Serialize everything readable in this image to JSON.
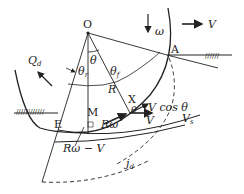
{
  "labels": {
    "O": "O",
    "A": "A",
    "E": "E",
    "M": "M",
    "X": "X",
    "R": "R",
    "omega": "ω",
    "V_top": "V",
    "Q_d": "Q",
    "Q_d_sub": "d",
    "theta": "θ",
    "theta_r": "θ",
    "theta_r_sub": "r",
    "theta_f": "θ",
    "theta_f_sub": "f",
    "R_omega": "Rω",
    "R_omega_minus_V": "Rω − V",
    "V_cos_theta": "V cos θ",
    "theta_small": "θ",
    "V_vec": "V",
    "V_s": "V",
    "V_s_sub": "s",
    "j_d": "j",
    "j_d_sub": "d"
  },
  "colors": {
    "stroke": "#222222",
    "background": "#ffffff"
  }
}
